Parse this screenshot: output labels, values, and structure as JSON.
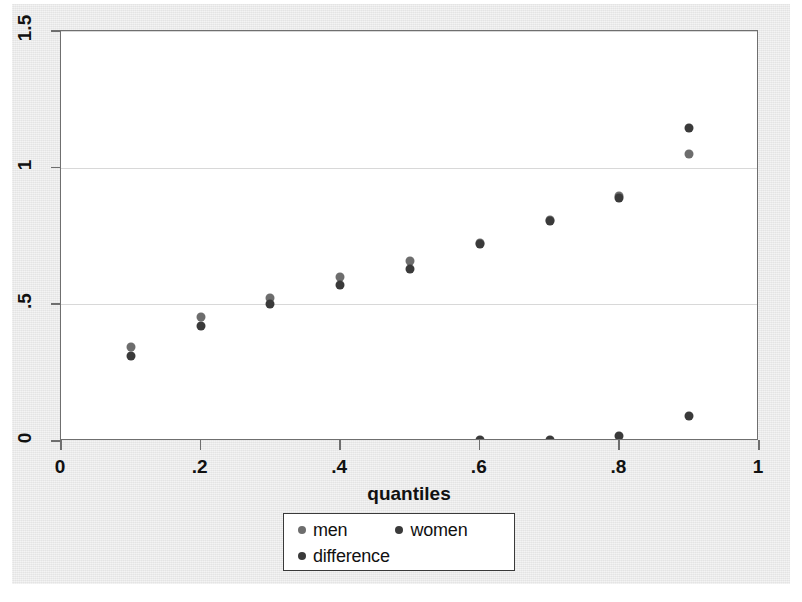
{
  "title": "",
  "chart_data": {
    "type": "scatter",
    "title": "",
    "xlabel": "quantiles",
    "ylabel": "",
    "xlim": [
      0,
      1
    ],
    "ylim": [
      0,
      1.5
    ],
    "xticks": [
      "0",
      ".2",
      ".4",
      ".6",
      ".8",
      "1"
    ],
    "xtick_values": [
      0,
      0.2,
      0.4,
      0.6,
      0.8,
      1
    ],
    "yticks": [
      "0",
      ".5",
      "1",
      "1.5"
    ],
    "ytick_values": [
      0,
      0.5,
      1,
      1.5
    ],
    "grid": "horizontal",
    "legend_position": "bottom-center",
    "x": [
      0.1,
      0.2,
      0.3,
      0.4,
      0.5,
      0.6,
      0.7,
      0.8,
      0.9
    ],
    "series": [
      {
        "name": "men",
        "color": "#6d6d6d",
        "values": [
          0.345,
          0.455,
          0.525,
          0.6,
          0.66,
          0.725,
          0.81,
          0.895,
          1.05
        ]
      },
      {
        "name": "women",
        "color": "#3a3a3a",
        "values": [
          0.31,
          0.42,
          0.5,
          0.57,
          0.63,
          0.72,
          0.805,
          0.89,
          1.145
        ]
      },
      {
        "name": "difference",
        "color": "#3a3a3a",
        "values": [
          -0.01,
          -0.01,
          -0.01,
          -0.02,
          -0.012,
          0.003,
          0.005,
          0.02,
          0.09
        ]
      }
    ]
  },
  "legend": {
    "items": [
      {
        "label": "men",
        "color": "#6d6d6d"
      },
      {
        "label": "women",
        "color": "#3a3a3a"
      },
      {
        "label": "difference",
        "color": "#3a3a3a"
      }
    ]
  },
  "colors": {
    "page_background": "#e8e8e8",
    "plot_background": "#ffffff",
    "frame": "#6f6f6f",
    "gridline": "#d8d8d8",
    "men": "#6d6d6d",
    "women": "#3a3a3a",
    "difference": "#3a3a3a"
  }
}
